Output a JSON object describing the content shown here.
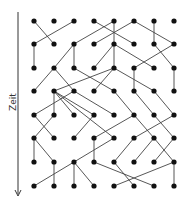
{
  "axis": {
    "label": "Zeit",
    "direction": "down"
  },
  "grid": {
    "columns": 8,
    "rows": 8,
    "x_positions": [
      34,
      54,
      74,
      94,
      114,
      134,
      154,
      174
    ],
    "y_positions": [
      21,
      44,
      68,
      91,
      115,
      138,
      162,
      186
    ]
  },
  "colors": {
    "node": "#111111",
    "edge": "#444444",
    "axis": "#333333"
  },
  "edges": [
    [
      [
        0,
        0
      ],
      [
        1,
        1
      ]
    ],
    [
      [
        2,
        0
      ],
      [
        0,
        1
      ]
    ],
    [
      [
        3,
        0
      ],
      [
        5,
        1
      ]
    ],
    [
      [
        4,
        0
      ],
      [
        2,
        1
      ]
    ],
    [
      [
        4,
        0
      ],
      [
        4,
        1
      ]
    ],
    [
      [
        5,
        0
      ],
      [
        3,
        1
      ]
    ],
    [
      [
        5,
        0
      ],
      [
        7,
        1
      ]
    ],
    [
      [
        6,
        0
      ],
      [
        6,
        1
      ]
    ],
    [
      [
        0,
        1
      ],
      [
        0,
        2
      ]
    ],
    [
      [
        2,
        1
      ],
      [
        1,
        2
      ]
    ],
    [
      [
        2,
        1
      ],
      [
        2,
        2
      ]
    ],
    [
      [
        4,
        1
      ],
      [
        3,
        2
      ]
    ],
    [
      [
        4,
        1
      ],
      [
        4,
        2
      ]
    ],
    [
      [
        4,
        1
      ],
      [
        6,
        2
      ]
    ],
    [
      [
        7,
        1
      ],
      [
        5,
        2
      ]
    ],
    [
      [
        6,
        1
      ],
      [
        7,
        2
      ]
    ],
    [
      [
        1,
        2
      ],
      [
        0,
        3
      ]
    ],
    [
      [
        1,
        2
      ],
      [
        2,
        3
      ]
    ],
    [
      [
        2,
        2
      ],
      [
        4,
        3
      ]
    ],
    [
      [
        4,
        2
      ],
      [
        1,
        3
      ]
    ],
    [
      [
        4,
        2
      ],
      [
        3,
        3
      ]
    ],
    [
      [
        4,
        2
      ],
      [
        6,
        3
      ]
    ],
    [
      [
        5,
        2
      ],
      [
        5,
        3
      ]
    ],
    [
      [
        7,
        2
      ],
      [
        7,
        3
      ]
    ],
    [
      [
        1,
        3
      ],
      [
        1,
        4
      ]
    ],
    [
      [
        1,
        3
      ],
      [
        2,
        4
      ]
    ],
    [
      [
        1,
        3
      ],
      [
        3,
        4
      ]
    ],
    [
      [
        1,
        3
      ],
      [
        4,
        5
      ]
    ],
    [
      [
        2,
        3
      ],
      [
        0,
        4
      ]
    ],
    [
      [
        2,
        3
      ],
      [
        4,
        4
      ]
    ],
    [
      [
        4,
        3
      ],
      [
        5,
        4
      ]
    ],
    [
      [
        5,
        3
      ],
      [
        6,
        4
      ]
    ],
    [
      [
        6,
        3
      ],
      [
        7,
        4
      ]
    ],
    [
      [
        0,
        4
      ],
      [
        1,
        5
      ]
    ],
    [
      [
        1,
        4
      ],
      [
        0,
        5
      ]
    ],
    [
      [
        3,
        4
      ],
      [
        2,
        5
      ]
    ],
    [
      [
        5,
        4
      ],
      [
        3,
        5
      ]
    ],
    [
      [
        5,
        4
      ],
      [
        6,
        5
      ]
    ],
    [
      [
        6,
        4
      ],
      [
        7,
        5
      ]
    ],
    [
      [
        7,
        4
      ],
      [
        5,
        5
      ]
    ],
    [
      [
        0,
        5
      ],
      [
        0,
        6
      ]
    ],
    [
      [
        0,
        5
      ],
      [
        1,
        6
      ]
    ],
    [
      [
        3,
        5
      ],
      [
        3,
        6
      ]
    ],
    [
      [
        4,
        5
      ],
      [
        2,
        6
      ]
    ],
    [
      [
        5,
        5
      ],
      [
        4,
        6
      ]
    ],
    [
      [
        6,
        5
      ],
      [
        5,
        6
      ]
    ],
    [
      [
        6,
        5
      ],
      [
        7,
        6
      ]
    ],
    [
      [
        7,
        5
      ],
      [
        6,
        6
      ]
    ],
    [
      [
        1,
        6
      ],
      [
        1,
        7
      ]
    ],
    [
      [
        2,
        6
      ],
      [
        0,
        7
      ]
    ],
    [
      [
        2,
        6
      ],
      [
        2,
        7
      ]
    ],
    [
      [
        2,
        6
      ],
      [
        3,
        7
      ]
    ],
    [
      [
        3,
        6
      ],
      [
        6,
        7
      ]
    ],
    [
      [
        4,
        6
      ],
      [
        5,
        7
      ]
    ],
    [
      [
        7,
        6
      ],
      [
        4,
        7
      ]
    ],
    [
      [
        7,
        6
      ],
      [
        7,
        7
      ]
    ]
  ]
}
